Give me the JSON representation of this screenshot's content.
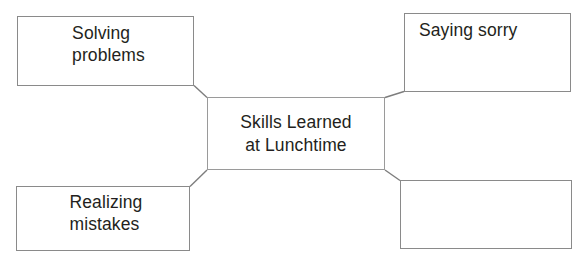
{
  "diagram": {
    "type": "concept-map",
    "center": {
      "label": "Skills Learned\nat Lunchtime"
    },
    "branches": [
      {
        "id": "solving-problems",
        "position": "top-left",
        "label": "Solving\nproblems"
      },
      {
        "id": "saying-sorry",
        "position": "top-right",
        "label": "Saying sorry"
      },
      {
        "id": "realizing-mistakes",
        "position": "bottom-left",
        "label": "Realizing\nmistakes"
      },
      {
        "id": "blank",
        "position": "bottom-right",
        "label": ""
      }
    ],
    "style": {
      "border_color": "#8a8a8a",
      "text_color": "#231f20",
      "background_color": "#ffffff",
      "connector_color": "#7d7d7d"
    }
  }
}
